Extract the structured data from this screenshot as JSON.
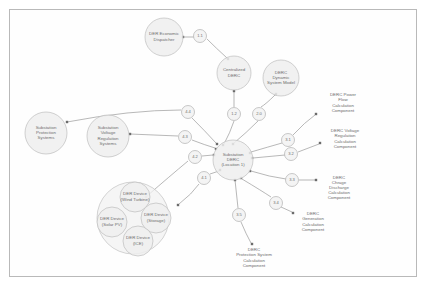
{
  "diagram": {
    "type": "node-link-graph",
    "colors": {
      "frame_border": "#b9b9b9",
      "node_fill": "#eeeeee",
      "node_stroke": "#bdbdbd",
      "group_fill": "#f2f2f2",
      "edge_stroke": "#9a9a9a",
      "text": "#6d6d6d",
      "background": "#ffffff"
    }
  },
  "nodes": [
    {
      "id": "der-economic-dispatcher",
      "label": "DER Economic\nDispatcher",
      "lines": [
        "DER Economic",
        "Dispatcher"
      ],
      "shape": "circle",
      "cx": 164,
      "cy": 37,
      "r": 19
    },
    {
      "id": "centralized-derc",
      "label": "Centralized\nDERC",
      "lines": [
        "Centralized",
        "DERC"
      ],
      "shape": "circle",
      "cx": 234,
      "cy": 73,
      "r": 17
    },
    {
      "id": "derc-dynamic-system-model",
      "label": "DERC\nDynamic\nSystem Model",
      "lines": [
        "DERC",
        "Dynamic",
        "System Model"
      ],
      "shape": "circle",
      "cx": 281,
      "cy": 78,
      "r": 18
    },
    {
      "id": "substation-derc-location-1",
      "label": "Substation\nDERC\n(Location 1)",
      "lines": [
        "Substation",
        "DERC",
        "(Location 1)"
      ],
      "shape": "circle",
      "cx": 233,
      "cy": 160,
      "r": 20
    },
    {
      "id": "substation-protection-systems",
      "label": "Substation\nProtection\nSystems",
      "lines": [
        "Substation",
        "Protection",
        "Systems"
      ],
      "shape": "circle",
      "cx": 46,
      "cy": 133,
      "r": 21
    },
    {
      "id": "substation-voltage-regulation-systems",
      "label": "Substation\nVoltage\nRegulation\nSystems",
      "lines": [
        "Substation",
        "Voltage",
        "Regulation",
        "Systems"
      ],
      "shape": "circle",
      "cx": 108,
      "cy": 136,
      "r": 21
    },
    {
      "id": "der-device-group",
      "label": "",
      "lines": [],
      "shape": "group-circle",
      "cx": 133,
      "cy": 218,
      "r": 36
    },
    {
      "id": "der-device-wind-turbine",
      "label": "DER Device\n(Wind Turbine)",
      "lines": [
        "DER Device",
        "(Wind Turbine)"
      ],
      "shape": "circle",
      "cx": 135,
      "cy": 197,
      "r": 15
    },
    {
      "id": "der-device-storage",
      "label": "DER Device\n(Storage)",
      "lines": [
        "DER Device",
        "(Storage)"
      ],
      "shape": "circle",
      "cx": 156,
      "cy": 218,
      "r": 15
    },
    {
      "id": "der-device-solar-pv",
      "label": "DER Device\n(Solar PV)",
      "lines": [
        "DER Device",
        "(Solar PV)"
      ],
      "shape": "circle",
      "cx": 112,
      "cy": 222,
      "r": 15
    },
    {
      "id": "der-device-ice",
      "label": "DER Device\n(ICE)",
      "lines": [
        "DER Device",
        "(ICE)"
      ],
      "shape": "circle",
      "cx": 138,
      "cy": 241,
      "r": 15
    }
  ],
  "text_nodes": [
    {
      "id": "derc-power-flow-calculation-component",
      "label": "DERC Power\nFlow\nCalculation\nComponent",
      "lines": [
        "DERC Power",
        "Flow",
        "Calculation",
        "Component"
      ],
      "cx": 343,
      "cy": 103
    },
    {
      "id": "derc-voltage-regulation-calculation-component",
      "label": "DERC Voltage\nRegulation\nCalculation\nComponent",
      "lines": [
        "DERC Voltage",
        "Regulation",
        "Calculation",
        "Component"
      ],
      "cx": 345,
      "cy": 139
    },
    {
      "id": "derc-chrage-discharge-calculation-component",
      "label": "DERC\nChrage\nDischarge\nCalculation\nComponent",
      "lines": [
        "DERC",
        "Chrage",
        "Discharge",
        "Calculation",
        "Component"
      ],
      "cx": 339,
      "cy": 188
    },
    {
      "id": "derc-generation-calculation-component",
      "label": "DERC\nGeneration\nCalculation\nComponent",
      "lines": [
        "DERC",
        "Generation",
        "Calculation",
        "Component"
      ],
      "cx": 313,
      "cy": 222
    },
    {
      "id": "derc-protection-system-calculation-component",
      "label": "DERC\nProtection System\nCalculation\nComponent",
      "lines": [
        "DERC",
        "Protection System",
        "Calculation",
        "Component"
      ],
      "cx": 254,
      "cy": 258
    }
  ],
  "edges": [
    {
      "id": "edge-1-1",
      "label": "1.1",
      "from": "der-economic-dispatcher",
      "to": "centralized-derc",
      "label_cx": 200,
      "label_cy": 36,
      "label_r": 6.5,
      "path": "M 183,37 L 194,37 M 207,39 Q 216,48 227,58",
      "arrow": {
        "x": 183,
        "y": 37
      },
      "arrow2": {
        "x": 228,
        "y": 59
      }
    },
    {
      "id": "edge-1-2",
      "label": "1.2",
      "from": "centralized-derc",
      "to": "substation-derc-location-1",
      "label_cx": 234,
      "label_cy": 114,
      "label_r": 6.5,
      "path": "M 234,90 L 234,107 M 234,121 Q 230,133 224,144",
      "arrow": {
        "x": 234,
        "y": 91
      },
      "arrow2": {
        "x": 223,
        "y": 145
      }
    },
    {
      "id": "edge-2-0",
      "label": "2.0",
      "from": "derc-dynamic-system-model",
      "to": "substation-derc-location-1",
      "label_cx": 259,
      "label_cy": 114,
      "label_r": 6.5,
      "path": "M 275,95 Q 266,104 261,107 M 258,121 Q 246,133 234,143",
      "arrow": {
        "x": 276,
        "y": 94
      },
      "arrow2": {
        "x": 233,
        "y": 144
      }
    },
    {
      "id": "edge-3-1",
      "label": "3.1",
      "from": "substation-derc-location-1",
      "to": "derc-power-flow-calculation-component",
      "label_cx": 288,
      "label_cy": 140,
      "label_r": 6.5,
      "path": "M 251,152 Q 268,147 282,143 M 293,135 Q 305,122 315,115",
      "arrow": {
        "x": 250,
        "y": 153
      },
      "arrow2": {
        "x": 316,
        "y": 114
      }
    },
    {
      "id": "edge-3-2",
      "label": "3.2",
      "from": "substation-derc-location-1",
      "to": "derc-voltage-regulation-calculation-component",
      "label_cx": 291,
      "label_cy": 154,
      "label_r": 6.5,
      "path": "M 253,158 L 285,155 M 298,152 L 319,144",
      "arrow": {
        "x": 252,
        "y": 158
      },
      "arrow2": {
        "x": 320,
        "y": 143
      }
    },
    {
      "id": "edge-3-3",
      "label": "3.3",
      "from": "substation-derc-location-1",
      "to": "derc-chrage-discharge-calculation-component",
      "label_cx": 292,
      "label_cy": 180,
      "label_r": 6.5,
      "path": "M 251,171 Q 270,177 286,179 M 299,180 L 315,180",
      "arrow": {
        "x": 250,
        "y": 171
      },
      "arrow2": {
        "x": 316,
        "y": 180
      }
    },
    {
      "id": "edge-3-4",
      "label": "3.4",
      "from": "substation-derc-location-1",
      "to": "derc-generation-calculation-component",
      "label_cx": 276,
      "label_cy": 203,
      "label_r": 6.5,
      "path": "M 242,179 Q 262,191 271,197 M 281,207 L 292,212",
      "arrow": {
        "x": 241,
        "y": 178
      },
      "arrow2": {
        "x": 293,
        "y": 213
      }
    },
    {
      "id": "edge-3-5",
      "label": "3.5",
      "from": "substation-derc-location-1",
      "to": "derc-protection-system-calculation-component",
      "label_cx": 239,
      "label_cy": 215,
      "label_r": 6.5,
      "path": "M 235,180 L 238,208 M 241,222 Q 246,234 251,243",
      "arrow": {
        "x": 235,
        "y": 180
      },
      "arrow2": {
        "x": 252,
        "y": 244
      }
    },
    {
      "id": "edge-4-1",
      "label": "4.1",
      "from": "der-device-group",
      "to": "substation-derc-location-1",
      "label_cx": 204,
      "label_cy": 178,
      "label_r": 6.5,
      "path": "M 179,204 Q 192,194 199,184 M 210,174 L 219,171",
      "arrow": {
        "x": 178,
        "y": 205
      },
      "arrow2": {
        "x": 220,
        "y": 170
      }
    },
    {
      "id": "edge-4-2",
      "label": "4.2",
      "from": "substation-voltage-regulation-systems",
      "to": "substation-derc-location-1",
      "label_cx": 195,
      "label_cy": 157,
      "label_r": 6.5,
      "path": "M 147,196 Q 170,176 188,161 M 202,156 L 213,155",
      "arrow": {
        "x": 146,
        "y": 197
      },
      "arrow2": {
        "x": 214,
        "y": 155
      }
    },
    {
      "id": "edge-4-3",
      "label": "4.3",
      "from": "substation-voltage-regulation-systems",
      "to": "substation-derc-location-1",
      "label_cx": 185,
      "label_cy": 137,
      "label_r": 6.5,
      "path": "M 130,134 L 178,136 M 192,140 Q 205,145 215,148",
      "arrow": {
        "x": 130,
        "y": 134
      },
      "arrow2": {
        "x": 216,
        "y": 149
      }
    },
    {
      "id": "edge-4-4",
      "label": "4.4",
      "from": "substation-protection-systems",
      "to": "substation-derc-location-1",
      "label_cx": 188,
      "label_cy": 112,
      "label_r": 6.5,
      "path": "M 67,122 Q 130,110 181,110 M 192,118 Q 205,131 216,143",
      "arrow": {
        "x": 67,
        "y": 122
      },
      "arrow2": {
        "x": 217,
        "y": 144
      }
    }
  ]
}
